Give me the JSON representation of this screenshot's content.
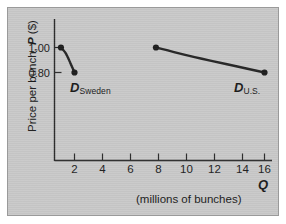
{
  "figure": {
    "background_color": "#c9c9c9",
    "border_color": "#9a9a9a",
    "ink_color": "#1d1d1d"
  },
  "axes": {
    "y_label": "Price per bunch,",
    "y_label_symbol": "P",
    "y_label_unit": "($)",
    "y_ticks": [
      "1.00",
      "0.80"
    ],
    "x_ticks": [
      "2",
      "4",
      "6",
      "8",
      "10",
      "12",
      "14",
      "16"
    ],
    "x_symbol": "Q",
    "x_caption": "(millions of bunches)"
  },
  "annotations": [
    {
      "symbol": "D",
      "subscript": "Sweden"
    },
    {
      "symbol": "D",
      "subscript": "U.S."
    }
  ],
  "chart_data": {
    "type": "line",
    "title": "",
    "xlabel": "Q (millions of bunches)",
    "ylabel": "Price per bunch, P ($)",
    "xlim": [
      0,
      16.8
    ],
    "ylim": [
      0.0,
      1.18
    ],
    "xticks": [
      2,
      4,
      6,
      8,
      10,
      12,
      14,
      16
    ],
    "yticks": [
      0.8,
      1.0
    ],
    "grid": false,
    "legend": "inline-annotations",
    "series": [
      {
        "name": "D Sweden",
        "label": "D_Sweden",
        "markers": [
          {
            "x": 1,
            "y": 1.0
          },
          {
            "x": 2,
            "y": 0.8
          }
        ],
        "curve": [
          {
            "x": 1.0,
            "y": 1.0
          },
          {
            "x": 1.35,
            "y": 0.955
          },
          {
            "x": 1.7,
            "y": 0.875
          },
          {
            "x": 2.0,
            "y": 0.8
          }
        ]
      },
      {
        "name": "D U.S.",
        "label": "D_U.S.",
        "markers": [
          {
            "x": 8,
            "y": 1.0
          },
          {
            "x": 16,
            "y": 0.8
          }
        ],
        "curve": [
          {
            "x": 8.0,
            "y": 1.0
          },
          {
            "x": 10.0,
            "y": 0.945
          },
          {
            "x": 12.0,
            "y": 0.895
          },
          {
            "x": 14.0,
            "y": 0.848
          },
          {
            "x": 16.0,
            "y": 0.8
          }
        ]
      }
    ]
  }
}
